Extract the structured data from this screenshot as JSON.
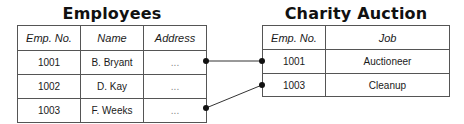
{
  "employees": {
    "title": "Employees",
    "headers": [
      "Emp. No.",
      "Name",
      "Address"
    ],
    "rows": [
      [
        "1001",
        "B. Bryant",
        "..."
      ],
      [
        "1002",
        "D. Kay",
        "..."
      ],
      [
        "1003",
        "F. Weeks",
        "..."
      ]
    ]
  },
  "charity": {
    "title": "Charity Auction",
    "headers": [
      "Emp. No.",
      "Job"
    ],
    "rows": [
      [
        "1001",
        "Auctioneer"
      ],
      [
        "1003",
        "Cleanup"
      ]
    ]
  },
  "links": [
    {
      "from": "Employees 1001",
      "to": "Charity Auction 1001"
    },
    {
      "from": "Employees 1003",
      "to": "Charity Auction 1003"
    }
  ]
}
